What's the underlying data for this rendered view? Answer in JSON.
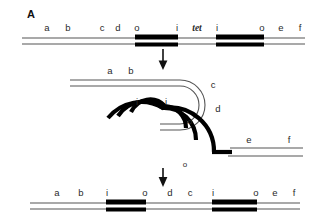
{
  "panel": {
    "letter": "A"
  },
  "colors": {
    "line": "#555555",
    "segment_black": "#000000",
    "text": "#2a2a2a",
    "background": "#ffffff"
  },
  "stages": {
    "top": {
      "name": "parent-duplex",
      "labels": [
        {
          "text": "a",
          "style": "plain"
        },
        {
          "text": "b",
          "style": "plain"
        },
        {
          "text": "c",
          "style": "plain"
        },
        {
          "text": "d",
          "style": "plain"
        },
        {
          "text": "o",
          "style": "plain"
        },
        {
          "text": "i",
          "style": "plain"
        },
        {
          "text": "tet",
          "style": "italic"
        },
        {
          "text": "i",
          "style": "plain"
        },
        {
          "text": "o",
          "style": "plain"
        },
        {
          "text": "e",
          "style": "plain"
        },
        {
          "text": "f",
          "style": "plain"
        }
      ]
    },
    "middle": {
      "name": "looped-intermediate",
      "labels": [
        {
          "text": "a",
          "style": "plain"
        },
        {
          "text": "b",
          "style": "plain"
        },
        {
          "text": "c",
          "style": "plain"
        },
        {
          "text": "d",
          "style": "plain"
        },
        {
          "text": "i",
          "style": "plain"
        },
        {
          "text": "i",
          "style": "plain"
        },
        {
          "text": "o",
          "style": "small"
        },
        {
          "text": "e",
          "style": "plain"
        },
        {
          "text": "f",
          "style": "plain"
        },
        {
          "text": "o",
          "style": "small"
        }
      ]
    },
    "bottom": {
      "name": "inverted-product-duplex",
      "labels": [
        {
          "text": "a",
          "style": "plain"
        },
        {
          "text": "b",
          "style": "plain"
        },
        {
          "text": "i",
          "style": "plain"
        },
        {
          "text": "o",
          "style": "plain"
        },
        {
          "text": "d",
          "style": "plain"
        },
        {
          "text": "c",
          "style": "plain"
        },
        {
          "text": "i",
          "style": "plain"
        },
        {
          "text": "o",
          "style": "plain"
        },
        {
          "text": "e",
          "style": "plain"
        },
        {
          "text": "f",
          "style": "plain"
        }
      ]
    }
  },
  "arrows": [
    {
      "name": "arrow-step-1"
    },
    {
      "name": "arrow-step-2"
    }
  ]
}
